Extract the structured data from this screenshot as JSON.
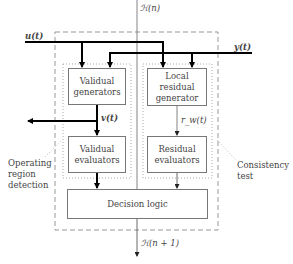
{
  "signals": {
    "input": "u(t)",
    "output": "y(t)",
    "hyp_in": "ℋ(n)",
    "hyp_out": "ℋ(n + 1)",
    "validual": "v(t)",
    "residual": "r_w(t)"
  },
  "blocks": {
    "validual_generators": "Validual generators",
    "local_residual_generator": "Local residual generator",
    "validual_evaluators": "Validual evaluators",
    "residual_evaluators": "Residual evaluators",
    "decision_logic": "Decision logic"
  },
  "annotations": {
    "operating_region": "Operating region detection",
    "consistency_test": "Consistency test"
  }
}
